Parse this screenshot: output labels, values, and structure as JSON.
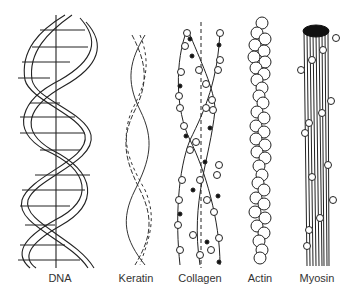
{
  "figure": {
    "labels": {
      "dna": "DNA",
      "keratin": "Keratin",
      "collagen": "Collagen",
      "actin": "Actin",
      "myosin": "Myosin"
    },
    "colors": {
      "stroke": "#222222",
      "fill": "#ffffff",
      "cap": "#111111"
    }
  }
}
